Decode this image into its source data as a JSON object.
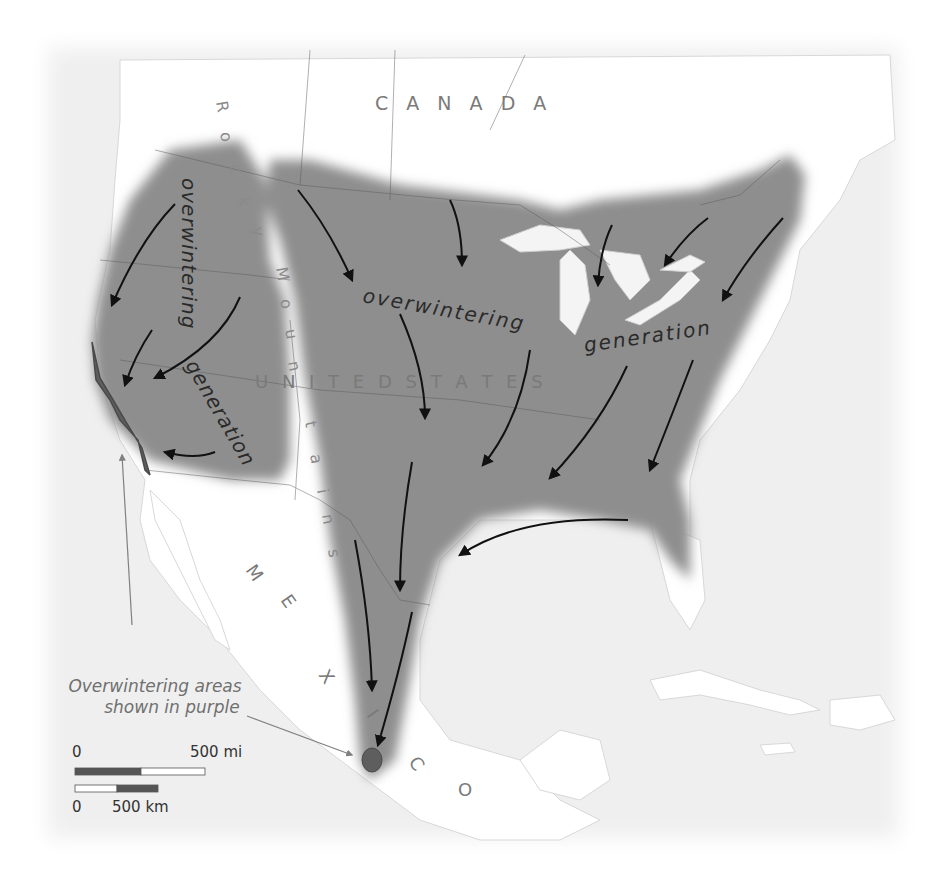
{
  "map": {
    "title_labels": {
      "canada": "C A N A D A",
      "united_states": "U N I T E D   S T A T E S",
      "mexico_letters": [
        "M",
        "E",
        "X",
        "I",
        "C",
        "O"
      ],
      "rocky_letters": [
        "R",
        "o",
        "c",
        "k",
        "y"
      ],
      "mountains_letters": [
        "M",
        "o",
        "u",
        "n",
        "t",
        "a",
        "i",
        "n",
        "s"
      ]
    },
    "generation_labels": {
      "west_overwintering": "overwintering",
      "west_generation": "generation",
      "east_overwintering": "overwintering",
      "east_generation": "generation"
    },
    "callout": {
      "line1": "Overwintering areas",
      "line2": "shown in purple"
    },
    "scale": {
      "mi_zero": "0",
      "mi_max": "500 mi",
      "km_zero": "0",
      "km_max": "500 km"
    },
    "colors": {
      "range_fill": "#8e8e8e",
      "overwinter_fill": "#6e6e6e",
      "land": "#ffffff",
      "water": "#efefef",
      "arrow": "#111111",
      "label_text": "#707070",
      "generation_text": "#2a2a2a"
    }
  }
}
